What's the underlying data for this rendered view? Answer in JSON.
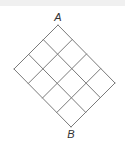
{
  "diagram": {
    "type": "grid-lattice",
    "rows": 3,
    "cols": 4,
    "line_color": "#7a7a7a",
    "corners": {
      "top": [
        58,
        25
      ],
      "left": [
        14,
        69
      ],
      "right": [
        115,
        83
      ],
      "bottom": [
        71,
        124
      ]
    },
    "labels": {
      "start": {
        "text": "A",
        "x": 58,
        "y": 17
      },
      "end": {
        "text": "B",
        "x": 71,
        "y": 134
      }
    }
  }
}
